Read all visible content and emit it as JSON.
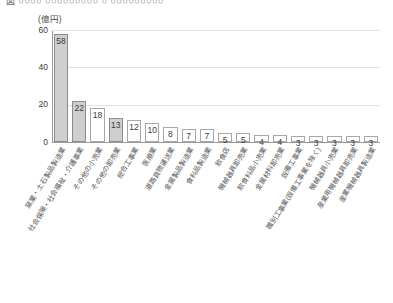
{
  "title_strip": {
    "cropped_caption": "図  ○○○○  ○○○○○○○○○  ○  ○○○○○○○○○"
  },
  "chart_data": {
    "type": "bar",
    "title": "",
    "subtitle": "",
    "unit_label": "(億円)",
    "xlabel": "",
    "ylabel": "",
    "ylim": [
      0,
      60
    ],
    "yticks": [
      0,
      20,
      40,
      60
    ],
    "ytick_labels": [
      "0",
      "20",
      "40",
      "60"
    ],
    "grid": true,
    "legend": "none",
    "highlight_color": "#cfcfcf",
    "bar_border_color": "#a8a8a8",
    "categories": [
      "窯業・土石製品製造業",
      "社会保険・社会福祉・介護事業",
      "その他の小売業",
      "その他の卸売業",
      "総合工事業",
      "医療業",
      "道路貨物運送業",
      "金属製品製造業",
      "食料品製造業",
      "飲食店",
      "機械器具卸売業",
      "飲食料品小売業",
      "金属材料卸売業",
      "設備工事業",
      "職別工事業(設備工事業を除く)",
      "機械器具小売業",
      "産業用機械器具卸売業",
      "産業機械器具製造業"
    ],
    "values": [
      58,
      22,
      18,
      13,
      12,
      10,
      8,
      7,
      7,
      5,
      5,
      4,
      4,
      3,
      3,
      3,
      3,
      3
    ],
    "highlighted": [
      true,
      true,
      false,
      true,
      false,
      false,
      false,
      false,
      false,
      false,
      false,
      false,
      false,
      false,
      false,
      false,
      false,
      false
    ]
  }
}
